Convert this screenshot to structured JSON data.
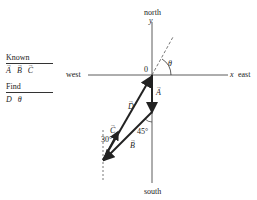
{
  "panel": {
    "known_heading": "Known",
    "known_items": [
      "A",
      "B",
      "C"
    ],
    "find_heading": "Find",
    "find_items": [
      "D",
      "θ"
    ]
  },
  "axes": {
    "north": "north",
    "south": "south",
    "east": "east",
    "west": "west",
    "x_label": "x",
    "y_label": "y",
    "origin_label": "0"
  },
  "vectors": {
    "A": "A",
    "B": "B",
    "C": "C",
    "D": "D"
  },
  "angles": {
    "theta": "θ",
    "angle_b": "45°",
    "angle_c": "30°"
  },
  "colors": {
    "line": "#222222",
    "axis": "#333333"
  }
}
